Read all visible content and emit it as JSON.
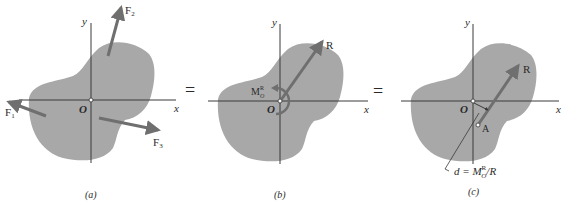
{
  "colors": {
    "body_fill": "#a8a8a8",
    "axis": "#3a3a3a",
    "arrow": "#6f6f6f",
    "text": "#2a2a2a",
    "background": "#ffffff"
  },
  "panels": [
    {
      "id": "a",
      "caption": "(a)",
      "axis_x_label": "x",
      "axis_y_label": "y",
      "origin_label": "O",
      "forces": [
        {
          "name": "F1",
          "label": "F",
          "sub": "1"
        },
        {
          "name": "F2",
          "label": "F",
          "sub": "2"
        },
        {
          "name": "F3",
          "label": "F",
          "sub": "3"
        }
      ]
    },
    {
      "id": "b",
      "caption": "(b)",
      "axis_x_label": "x",
      "axis_y_label": "y",
      "origin_label": "O",
      "resultant_label": "R",
      "moment_label": "M",
      "moment_sup": "R",
      "moment_sub": "O"
    },
    {
      "id": "c",
      "caption": "(c)",
      "axis_x_label": "x",
      "axis_y_label": "y",
      "origin_label": "O",
      "resultant_label": "R",
      "point_label": "A",
      "distance_eq": {
        "lhs": "d = M",
        "sup": "R",
        "sub": "O",
        "rhs": "/R"
      }
    }
  ],
  "equals_signs": [
    "=",
    "="
  ]
}
